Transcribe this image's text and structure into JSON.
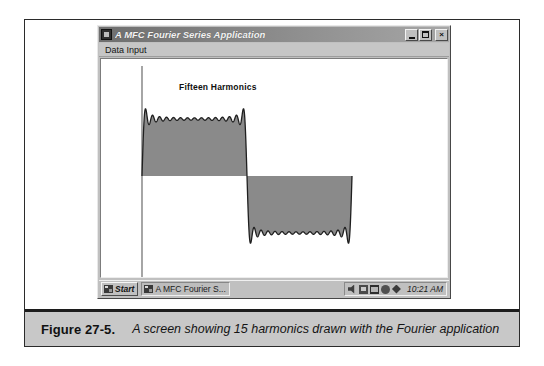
{
  "figure": {
    "label": "Figure 27-5.",
    "caption": "A screen showing 15 harmonics drawn with the Fourier application"
  },
  "window": {
    "title": "A MFC Fourier Series Application",
    "icon": "app-icon",
    "controls": {
      "minimize": "_",
      "maximize": "restore-icon",
      "close": "×"
    },
    "menu": [
      {
        "label": "Data Input"
      }
    ]
  },
  "plot": {
    "title": "Fifteen Harmonics",
    "axis_color": "#555555",
    "wave_stroke": "#1f1f1f",
    "wave_fill": "#8a8a8a"
  },
  "taskbar": {
    "start_label": "Start",
    "start_icon": "windows-flag-icon",
    "tasks": [
      {
        "label": "A MFC Fourier S...",
        "icon": "app-icon"
      }
    ],
    "tray_icons": [
      "volume-icon",
      "display-icon",
      "network-icon",
      "battery-icon",
      "pointer-icon"
    ],
    "clock": "10:21 AM"
  },
  "chart_data": {
    "type": "line",
    "title": "Fifteen Harmonics",
    "harmonics": 15,
    "odd_harmonic_orders": [
      1,
      3,
      5,
      7,
      9,
      11,
      13,
      15,
      17,
      19,
      21,
      23,
      25,
      27,
      29
    ],
    "waveform": "square",
    "amplitude": 1.0,
    "periods_shown": 1,
    "xlabel": "",
    "ylabel": "",
    "xlim": [
      0,
      1
    ],
    "ylim": [
      -1.3,
      1.3
    ],
    "grid": false,
    "legend": false,
    "series": [
      {
        "name": "Fifteen Harmonics",
        "formula": "f(t) = (4/pi) * sum_{k=1,3,5,...,29} sin(2*pi*k*t)/k",
        "fill": "#8a8a8a",
        "stroke": "#1f1f1f"
      }
    ]
  }
}
